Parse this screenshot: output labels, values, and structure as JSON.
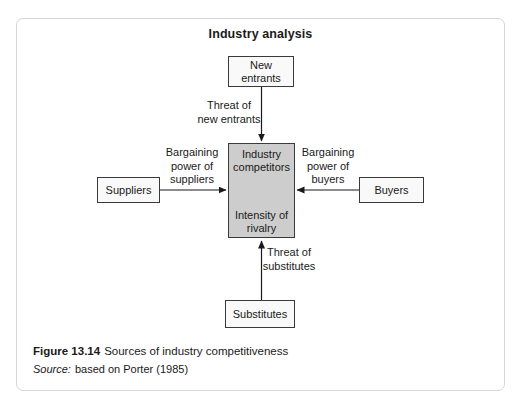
{
  "page": {
    "title": "Industry analysis"
  },
  "nodes": {
    "new_entrants": {
      "label": "New\nentrants"
    },
    "suppliers": {
      "label": "Suppliers"
    },
    "buyers": {
      "label": "Buyers"
    },
    "substitutes": {
      "label": "Substitutes"
    },
    "industry_competitors": {
      "label_top": "Industry\ncompetitors",
      "label_bottom": "Intensity of\nrivalry"
    }
  },
  "edge_labels": {
    "threat_new_entrants": "Threat of\nnew entrants",
    "bargaining_suppliers": "Bargaining\npower of\nsuppliers",
    "bargaining_buyers": "Bargaining\npower of\nbuyers",
    "threat_substitutes": "Threat of\nsubstitutes"
  },
  "caption": {
    "figure_label": "Figure 13.14",
    "figure_text": "Sources of industry competitiveness",
    "source_label": "Source:",
    "source_text": "based on Porter (1985)"
  },
  "colors": {
    "center_node_fill": "#cdcdcd",
    "node_fill": "#f9f9f9",
    "node_border": "#3a3a3a",
    "arrow": "#1a1a1a",
    "frame_border": "#d6d6d6",
    "text": "#1a1a1a"
  }
}
